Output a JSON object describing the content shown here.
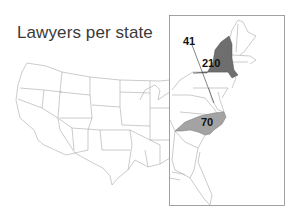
{
  "title": "Lawyers per state",
  "colors": {
    "background": "#ffffff",
    "state_border": "#9a9a9a",
    "highlight_dark": "#6e6e6e",
    "highlight_light": "#a3a3a3",
    "inset_frame": "#8a8a8a",
    "label": "#111111"
  },
  "inset": {
    "region": "East Coast",
    "frame": true
  },
  "annotations": [
    {
      "state": "Delaware",
      "value": "41",
      "leader_line": true
    },
    {
      "state": "New York",
      "value": "210",
      "shade": "dark"
    },
    {
      "state": "North Carolina",
      "value": "70",
      "shade": "light"
    }
  ]
}
